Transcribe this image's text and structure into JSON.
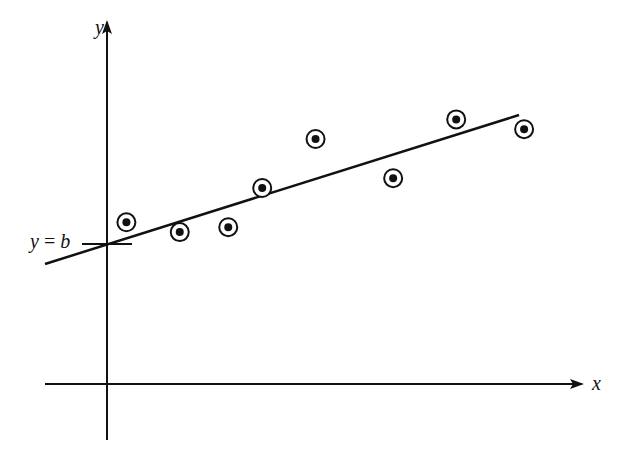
{
  "chart_data": {
    "type": "scatter",
    "title": "",
    "xlabel": "x",
    "ylabel": "y",
    "grid": false,
    "legend": null,
    "annotations": [
      {
        "text": "y = b",
        "target": "y-intercept of fitted line"
      }
    ],
    "points": [
      {
        "x": 0.4,
        "y": 3.3
      },
      {
        "x": 1.5,
        "y": 3.1
      },
      {
        "x": 2.5,
        "y": 3.2
      },
      {
        "x": 3.2,
        "y": 4.0
      },
      {
        "x": 4.3,
        "y": 5.0
      },
      {
        "x": 5.9,
        "y": 4.2
      },
      {
        "x": 7.2,
        "y": 5.4
      },
      {
        "x": 8.6,
        "y": 5.2
      }
    ],
    "fit_line": {
      "intercept_label": "b",
      "x_start": -1.3,
      "y_start": 2.5,
      "x_end": 8.6,
      "y_end": 5.6
    },
    "marker": "dot-in-circle",
    "axis_ranges": {
      "x": [
        -1.3,
        10
      ],
      "y": [
        -1.2,
        7.6
      ]
    }
  },
  "labels": {
    "x_axis": "x",
    "y_axis": "y",
    "intercept_y": "y",
    "intercept_eq": "=",
    "intercept_b": "b"
  },
  "colors": {
    "ink": "#111111",
    "background": "#ffffff"
  }
}
